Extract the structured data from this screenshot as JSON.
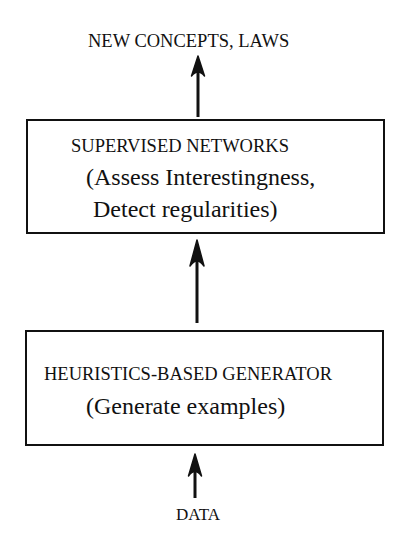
{
  "diagram": {
    "output_label": "NEW CONCEPTS, LAWS",
    "input_label": "DATA",
    "top_box": {
      "title": "SUPERVISED  NETWORKS",
      "line1": "(Assess Interestingness,",
      "line2": "Detect regularities)"
    },
    "bottom_box": {
      "title": "HEURISTICS-BASED GENERATOR",
      "line1": "(Generate examples)"
    },
    "flow": [
      {
        "from": "DATA",
        "to": "HEURISTICS-BASED GENERATOR"
      },
      {
        "from": "HEURISTICS-BASED GENERATOR",
        "to": "SUPERVISED NETWORKS"
      },
      {
        "from": "SUPERVISED NETWORKS",
        "to": "NEW CONCEPTS, LAWS"
      }
    ],
    "colors": {
      "ink": "#111111",
      "background": "#ffffff"
    }
  }
}
